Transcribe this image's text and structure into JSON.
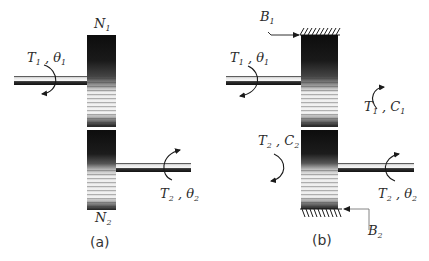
{
  "figure": {
    "panels": [
      {
        "id": "a",
        "caption": "(a)",
        "gears": [
          {
            "name": "N",
            "sub": "1",
            "position": "top"
          },
          {
            "name": "N",
            "sub": "2",
            "position": "bottom"
          }
        ],
        "shafts": [
          {
            "label": {
              "T": "T",
              "T_sub": "1",
              "sep": " , ",
              "angle": "θ",
              "angle_sub": "1"
            },
            "side": "left"
          },
          {
            "label": {
              "T": "T",
              "T_sub": "2",
              "sep": " , ",
              "angle": "θ",
              "angle_sub": "2"
            },
            "side": "right"
          }
        ]
      },
      {
        "id": "b",
        "caption": "(b)",
        "grounds": [
          {
            "name": "B",
            "sub": "1",
            "position": "top"
          },
          {
            "name": "B",
            "sub": "2",
            "position": "bottom"
          }
        ],
        "shafts": [
          {
            "label": {
              "T": "T",
              "T_sub": "1",
              "sep": " , ",
              "angle": "θ",
              "angle_sub": "1"
            },
            "side": "left"
          },
          {
            "label": {
              "T": "T",
              "T_sub": "2",
              "sep": " , ",
              "angle": "θ",
              "angle_sub": "2"
            },
            "side": "right"
          }
        ],
        "reactions": [
          {
            "T": "T",
            "T_sub": "1",
            "sep": " , ",
            "C": "C",
            "C_sub": "1"
          },
          {
            "T": "T",
            "T_sub": "2",
            "sep": " , ",
            "C": "C",
            "C_sub": "2"
          }
        ]
      }
    ],
    "colors": {
      "ink": "#1a1a1a",
      "gear_dark": "#111111",
      "gear_light": "#f2f2f2",
      "shaft_light": "#e8e8e8",
      "leader": "#555555"
    }
  }
}
